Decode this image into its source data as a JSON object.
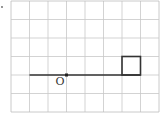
{
  "diagram": {
    "type": "grid-geometry",
    "grid": {
      "columns": 8,
      "rows": 6,
      "origin_px": [
        11,
        1
      ],
      "cell_px": 18.5,
      "line_color": "#c8c8c8",
      "border_color": "#bdbdbd"
    },
    "segment": {
      "from_cell": [
        1,
        4
      ],
      "to_cell": [
        7,
        4
      ],
      "color": "#333333"
    },
    "point": {
      "label": "O",
      "cell": [
        3,
        4
      ],
      "color": "#222222"
    },
    "square": {
      "top_left_cell": [
        6,
        3
      ],
      "size_cells": 1,
      "color": "#333333"
    },
    "stray_mark": {
      "px": [
        2,
        7
      ]
    }
  }
}
